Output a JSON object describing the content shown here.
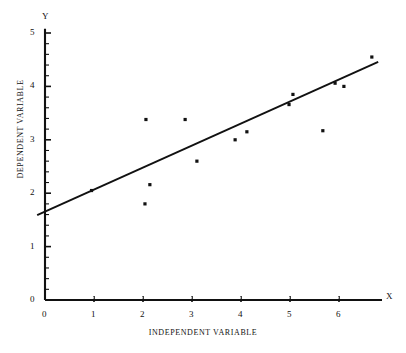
{
  "chart_data": {
    "type": "scatter",
    "title": "",
    "xlabel": "INDEPENDENT VARIABLE",
    "ylabel": "DEPENDENT VARIABLE",
    "x_axis_letter": "X",
    "y_axis_letter": "Y",
    "xlim": [
      0,
      7.0
    ],
    "ylim": [
      0,
      5.0
    ],
    "x_ticks": [
      0,
      1,
      2,
      3,
      4,
      5,
      6
    ],
    "x_tick_labels": [
      "0",
      "1",
      "2",
      "3",
      "4",
      "5",
      "6"
    ],
    "y_ticks": [
      0,
      1,
      2,
      3,
      4,
      5
    ],
    "y_tick_labels": [
      "0",
      "1",
      "2",
      "3",
      "4",
      "5"
    ],
    "x_minor_tick_step": 0.2,
    "y_minor_tick_step": 0.2,
    "grid": false,
    "legend": false,
    "marker": "square-dot",
    "marker_color": "#111111",
    "line_color": "#111111",
    "axis_color": "#111111",
    "points": [
      {
        "x": 0.95,
        "y": 2.05
      },
      {
        "x": 2.06,
        "y": 3.38
      },
      {
        "x": 2.14,
        "y": 2.16
      },
      {
        "x": 2.04,
        "y": 1.8
      },
      {
        "x": 2.86,
        "y": 3.38
      },
      {
        "x": 3.1,
        "y": 2.6
      },
      {
        "x": 3.88,
        "y": 3.0
      },
      {
        "x": 4.12,
        "y": 3.15
      },
      {
        "x": 4.98,
        "y": 3.66
      },
      {
        "x": 5.06,
        "y": 3.85
      },
      {
        "x": 5.67,
        "y": 3.17
      },
      {
        "x": 5.92,
        "y": 4.06
      },
      {
        "x": 6.1,
        "y": 4.0
      },
      {
        "x": 6.67,
        "y": 4.55
      }
    ],
    "fit_line": {
      "name": "regression line",
      "x_start": -0.16,
      "y_start": 1.59,
      "x_end": 6.8,
      "y_end": 4.46,
      "slope": 0.413,
      "intercept": 1.656
    }
  }
}
